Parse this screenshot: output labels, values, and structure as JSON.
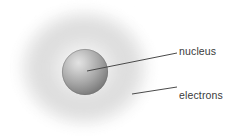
{
  "figure": {
    "background_color": "#ffffff"
  },
  "labels": [
    {
      "id": "nucleus",
      "text": "nucleus",
      "color": "#3a3a3a",
      "x": 179,
      "y": 46
    },
    {
      "id": "electrons",
      "text": "electrons",
      "color": "#3a3a3a",
      "x": 179,
      "y": 90
    }
  ],
  "diagram": {
    "electron_cloud": {
      "name": "electron-cloud",
      "center_x": 84,
      "center_y": 68,
      "radius_x": 70,
      "radius_y": 63,
      "edge_color": "#ffffff",
      "band_color": "#e0e0e0",
      "inner_color": "#fafafa"
    },
    "nucleus_sphere": {
      "name": "nucleus-sphere",
      "center_x": 85,
      "center_y": 72,
      "radius": 23,
      "highlight_color": "#dedede",
      "mid_color": "#a8a8a8",
      "shadow_color": "#707070",
      "edge_color": "#6b6b6b"
    },
    "leader_lines": [
      {
        "name": "nucleus-leader-line",
        "x1": 87,
        "y1": 71,
        "x2": 177,
        "y2": 53,
        "color": "#4a4a4a",
        "width": 1
      },
      {
        "name": "electrons-leader-line",
        "x1": 132,
        "y1": 94,
        "x2": 177,
        "y2": 87,
        "color": "#4a4a4a",
        "width": 1
      }
    ]
  }
}
